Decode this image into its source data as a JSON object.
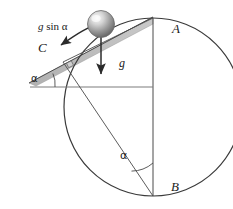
{
  "figure": {
    "type": "physics-diagram",
    "background_color": "#ffffff",
    "stroke_color": "#3a3a3a",
    "incline_fill": "#b8b8b8",
    "ball_color_light": "#f2f2f2",
    "ball_color_dark": "#6e6e6e"
  },
  "labels": {
    "point_a": "A",
    "point_b": "B",
    "point_c": "C",
    "gravity": "g",
    "gravity_component_prefix": "g",
    "gravity_component_rest": " sin α",
    "angle_incline": "α",
    "angle_at_b": "α"
  },
  "geometry": {
    "circle_center_x": 153,
    "circle_center_y": 107,
    "circle_radius": 89,
    "point_a_x": 153,
    "point_a_y": 18,
    "point_b_x": 153,
    "point_b_y": 196,
    "point_c_x": 63,
    "point_c_y": 62,
    "incline_angle_deg": 24,
    "horizontal_line_y": 87,
    "horizontal_line_x1": 30,
    "horizontal_line_x2": 153,
    "ball_center_x": 101,
    "ball_center_y": 24,
    "ball_radius": 13,
    "gravity_arrow_x": 101,
    "gravity_arrow_y1": 30,
    "gravity_arrow_y2": 75
  },
  "annotations": {
    "right_angle_marker_at_c": true,
    "arc_marker_at_incline": true,
    "arc_marker_at_b": true
  }
}
